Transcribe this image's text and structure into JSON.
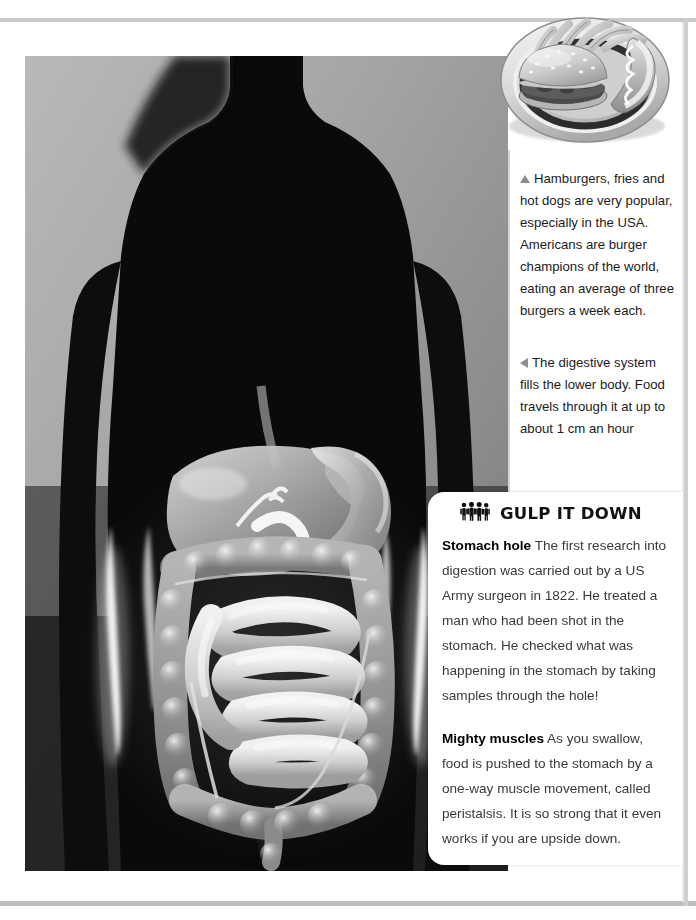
{
  "page": {
    "kind": "book-page-spread",
    "frame_color": "#c9c9c9",
    "background": "#ffffff"
  },
  "figures": {
    "food_photo": {
      "name": "plate-of-fast-food-photo",
      "subjects": [
        "hamburger",
        "french fries",
        "hot dog",
        "white plate"
      ],
      "style": "black-and-white photograph"
    },
    "torso_figure": {
      "name": "digestive-system-in-torso-illustration",
      "subjects": [
        "human torso silhouette",
        "liver",
        "stomach",
        "large intestine",
        "small intestine",
        "appendix"
      ],
      "style": "x-ray style illustration, grayscale"
    }
  },
  "captions": [
    {
      "id": "caption-food",
      "marker": "triangle-up",
      "marker_color": "#8d8d8d",
      "text": "Hamburgers, fries and hot dogs are very popular, especially in the USA. Americans are burger champions of the world, eating an average of three burgers a week each."
    },
    {
      "id": "caption-system",
      "marker": "triangle-left",
      "marker_color": "#8d8d8d",
      "text": "The digestive system fills the lower body. Food travels through it at up to about 1 cm an hour"
    }
  ],
  "fact_box": {
    "icon": "group-of-people-icon",
    "title": "GULP IT DOWN",
    "paragraphs": [
      {
        "lead": "Stomach hole",
        "body": " The first research into digestion was carried out by a US Army surgeon in 1822.  He treated a man who had been shot in the stomach. He checked what was happening in the stomach by taking samples through the hole!"
      },
      {
        "lead": "Mighty muscles",
        "body": " As you swallow, food is pushed to the stomach by a one-way muscle movement, called peristalsis. It is so strong that it even works if you are upside down."
      }
    ]
  }
}
